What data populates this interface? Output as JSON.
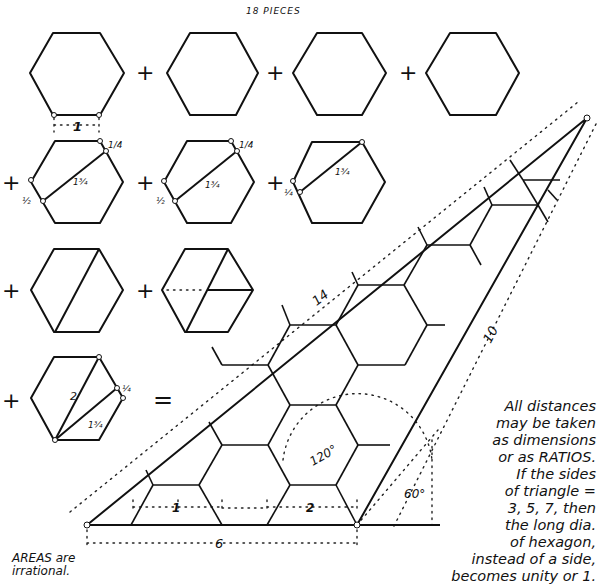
{
  "title": "18 PIECES",
  "pieces": {
    "row1": {
      "count": 4,
      "description": "four whole hexagons",
      "edge_label": "1"
    },
    "row2": [
      {
        "labels": [
          "1/4",
          "1 3/4",
          "1/2"
        ],
        "description": "hexagon cut by a chord"
      },
      {
        "labels": [
          "1/4",
          "1 3/4",
          "1/2"
        ],
        "description": "hexagon cut by a chord"
      },
      {
        "labels": [
          "1 3/4",
          "1/4"
        ],
        "description": "hexagon cut by a chord"
      }
    ],
    "row3": [
      {
        "description": "hexagon cut by a long diagonal"
      },
      {
        "description": "hexagon cut into three pieces"
      }
    ],
    "row4": {
      "labels": [
        "2",
        "1 3/4",
        "1/4"
      ],
      "description": "hexagon cut by two lines"
    },
    "operators": {
      "plus": "+",
      "equals": "="
    }
  },
  "triangle": {
    "side_labels": {
      "hypotenuse": "14",
      "right_side": "10",
      "base": "6"
    },
    "angles": {
      "obtuse": "120°",
      "base_angle": "60°"
    },
    "segment_labels": [
      "1",
      "2"
    ]
  },
  "notes": [
    "All distances",
    "may be taken",
    "as dimensions",
    "or as RATIOS.",
    "If the sides",
    "of triangle =",
    "3, 5, 7, then",
    "the long dia.",
    "of hexagon,",
    "instead of a side,",
    "becomes unity or 1."
  ],
  "areas_note": [
    "AREAS are",
    "irrational."
  ]
}
